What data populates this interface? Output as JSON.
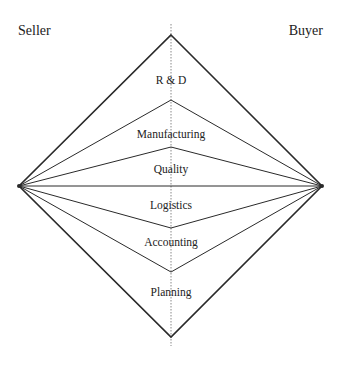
{
  "diagram": {
    "title": "",
    "parties": {
      "left": "Seller",
      "right": "Buyer"
    },
    "functions": [
      {
        "label": "R & D",
        "y": 75
      },
      {
        "label": "Manufacturing",
        "y": 133
      },
      {
        "label": "Quality",
        "y": 173
      },
      {
        "label": "Logistics",
        "y": 210
      },
      {
        "label": "Accounting",
        "y": 246
      },
      {
        "label": "Planning",
        "y": 296
      }
    ],
    "colors": {
      "line": "#2a2a2a",
      "text": "#222222",
      "axis": "#888888"
    }
  }
}
